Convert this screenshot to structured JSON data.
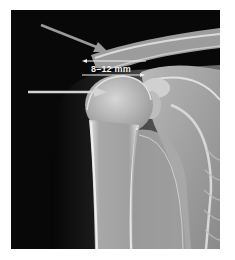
{
  "figure": {
    "type": "shoulder radiograph",
    "annotations": {
      "measurement_label": "8–12 mm",
      "arrows": [
        {
          "name": "upper-arrow",
          "direction": "down-right"
        },
        {
          "name": "lower-arrow",
          "direction": "right"
        }
      ]
    },
    "colors": {
      "background": "#0a0a0a",
      "bone": "#d8d8d8",
      "annotation": "#e8e8e8"
    }
  }
}
